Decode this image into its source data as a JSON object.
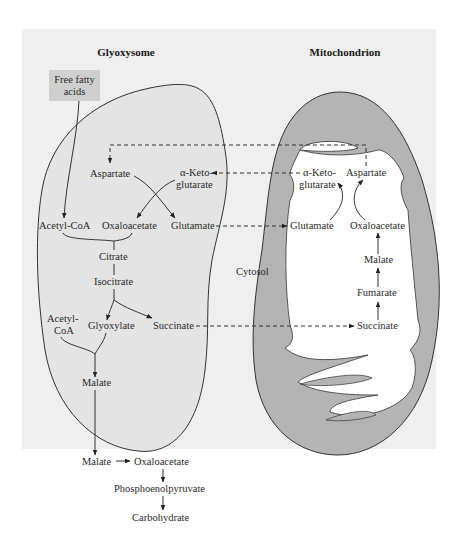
{
  "titles": {
    "glyoxysome": "Glyoxysome",
    "mitochondrion": "Mitochondrion",
    "cytosol": "Cytosol"
  },
  "input_box": {
    "line1": "Free fatty",
    "line2": "acids"
  },
  "glyoxysome": {
    "aspartate": "Aspartate",
    "akg_line1": "α-Keto-",
    "akg_line2": "glutarate",
    "acetyl_coa": "Acetyl-CoA",
    "oxaloacetate": "Oxaloacetate",
    "glutamate": "Glutamate",
    "citrate": "Citrate",
    "isocitrate": "Isocitrate",
    "acetyl_coa2_line1": "Acetyl-",
    "acetyl_coa2_line2": "CoA",
    "glyoxylate": "Glyoxylate",
    "succinate": "Succinate",
    "malate": "Malate"
  },
  "mitochondrion": {
    "akg_line1": "α-Keto-",
    "akg_line2": "glutarate",
    "aspartate": "Aspartate",
    "glutamate": "Glutamate",
    "oxaloacetate": "Oxaloacetate",
    "malate": "Malate",
    "fumarate": "Fumarate",
    "succinate": "Succinate"
  },
  "cytosol_path": {
    "malate": "Malate",
    "oxaloacetate": "Oxaloacetate",
    "pep": "Phosphoenolpyruvate",
    "carbohydrate": "Carbohydrate"
  },
  "colors": {
    "panel": "#efefef",
    "glyoxysome_fill": "#e4e4e4",
    "membrane_gray": "#b4b4b4",
    "input_box": "#cfcfcf",
    "matrix": "#ffffff"
  }
}
